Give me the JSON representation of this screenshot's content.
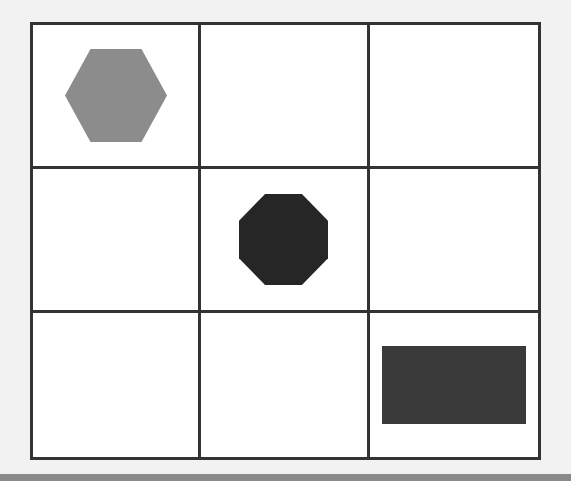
{
  "scene": {
    "title": "3x3 shape grid",
    "background_color": "#f2f2f2",
    "bottom_bar_color": "#8a8a8a",
    "cell_fill_color": "#ffffff",
    "grid_line_color": "#333333",
    "grid_line_width": 3,
    "grid": {
      "rows": 3,
      "columns": 3,
      "left": 30,
      "top": 22,
      "width": 511,
      "height": 438
    }
  },
  "cells": [
    {
      "id": "cell-r1c1",
      "row": 1,
      "col": 1,
      "shape": "hexagon",
      "shape_color": "#8c8c8c",
      "shape_width": 102,
      "shape_height": 93
    },
    {
      "id": "cell-r1c2",
      "row": 1,
      "col": 2,
      "shape": "none",
      "shape_color": "",
      "shape_width": 0,
      "shape_height": 0
    },
    {
      "id": "cell-r1c3",
      "row": 1,
      "col": 3,
      "shape": "none",
      "shape_color": "",
      "shape_width": 0,
      "shape_height": 0
    },
    {
      "id": "cell-r2c1",
      "row": 2,
      "col": 1,
      "shape": "none",
      "shape_color": "",
      "shape_width": 0,
      "shape_height": 0
    },
    {
      "id": "cell-r2c2",
      "row": 2,
      "col": 2,
      "shape": "octagon",
      "shape_color": "#262626",
      "shape_width": 89,
      "shape_height": 91
    },
    {
      "id": "cell-r2c3",
      "row": 2,
      "col": 3,
      "shape": "none",
      "shape_color": "",
      "shape_width": 0,
      "shape_height": 0
    },
    {
      "id": "cell-r3c1",
      "row": 3,
      "col": 1,
      "shape": "none",
      "shape_color": "",
      "shape_width": 0,
      "shape_height": 0
    },
    {
      "id": "cell-r3c2",
      "row": 3,
      "col": 2,
      "shape": "none",
      "shape_color": "",
      "shape_width": 0,
      "shape_height": 0
    },
    {
      "id": "cell-r3c3",
      "row": 3,
      "col": 3,
      "shape": "rectangle",
      "shape_color": "#3a3a3a",
      "shape_width": 144,
      "shape_height": 78
    }
  ],
  "shapes": [
    {
      "name": "hexagon",
      "color": "#8c8c8c",
      "cell": "row 1, column 1"
    },
    {
      "name": "octagon",
      "color": "#262626",
      "cell": "row 2, column 2"
    },
    {
      "name": "rectangle",
      "color": "#3a3a3a",
      "cell": "row 3, column 3"
    }
  ]
}
